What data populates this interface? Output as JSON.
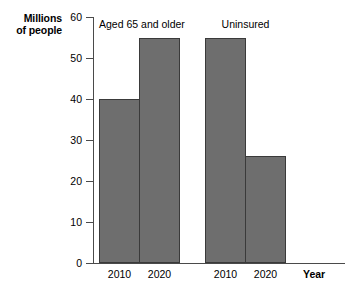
{
  "chart_data": {
    "type": "bar",
    "title": "",
    "xlabel": "Year",
    "ylabel": "Millions of people",
    "ylabel_lines": [
      "Millions",
      "of people"
    ],
    "ylim": [
      0,
      60
    ],
    "yticks": [
      0,
      10,
      20,
      30,
      40,
      50,
      60
    ],
    "ytick_labels": [
      "0",
      "10",
      "20",
      "30",
      "40",
      "50",
      "60"
    ],
    "grid": false,
    "legend": false,
    "categories": [
      "2010",
      "2020"
    ],
    "groups": [
      {
        "name": "Aged 65 and older",
        "bars": [
          {
            "category": "2010",
            "value": 40
          },
          {
            "category": "2020",
            "value": 55
          }
        ]
      },
      {
        "name": "Uninsured",
        "bars": [
          {
            "category": "2010",
            "value": 55
          },
          {
            "category": "2020",
            "value": 26
          }
        ]
      }
    ],
    "bar_color": "#6e6e6e",
    "bar_edge_color": "#3a3a3a",
    "axis_color": "#4a4a4a",
    "background": "#ffffff"
  }
}
